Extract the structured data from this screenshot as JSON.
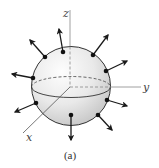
{
  "figure": {
    "caption": "(a)",
    "colors": {
      "sphere_fill_light": "#fbfbfb",
      "sphere_fill_dark": "#cfcfcf",
      "outline": "#333333",
      "axis": "#9a9a9a",
      "arrow": "#1a1a1a",
      "dot": "#111111"
    },
    "sphere": {
      "cx": 71,
      "cy": 86,
      "r": 39.5
    },
    "equator": {
      "cx": 71,
      "cy": 87,
      "rx": 39.5,
      "ry": 10.5
    },
    "axes": {
      "origin": {
        "x": 70,
        "y": 87
      },
      "z": {
        "label": "z",
        "end": {
          "x": 70,
          "y": 10
        }
      },
      "y": {
        "label": "y",
        "end": {
          "x": 141,
          "y": 87
        }
      },
      "x": {
        "label": "x",
        "end": {
          "x": 23,
          "y": 133
        }
      }
    },
    "vectors": [
      {
        "id": "v1",
        "dot": {
          "x": 63,
          "y": 52
        },
        "tip": {
          "x": 59,
          "y": 29
        }
      },
      {
        "id": "v2",
        "dot": {
          "x": 45,
          "y": 57
        },
        "tip": {
          "x": 30,
          "y": 40
        }
      },
      {
        "id": "v3",
        "dot": {
          "x": 33,
          "y": 78
        },
        "tip": {
          "x": 12,
          "y": 74
        }
      },
      {
        "id": "v4",
        "dot": {
          "x": 36,
          "y": 103
        },
        "tip": {
          "x": 15,
          "y": 112
        }
      },
      {
        "id": "v5",
        "dot": {
          "x": 71,
          "y": 115
        },
        "tip": {
          "x": 71,
          "y": 140
        }
      },
      {
        "id": "v6",
        "dot": {
          "x": 98,
          "y": 115
        },
        "tip": {
          "x": 112,
          "y": 130
        }
      },
      {
        "id": "v7",
        "dot": {
          "x": 107,
          "y": 100
        },
        "tip": {
          "x": 127,
          "y": 106
        }
      },
      {
        "id": "v8",
        "dot": {
          "x": 106,
          "y": 71
        },
        "tip": {
          "x": 127,
          "y": 61
        }
      },
      {
        "id": "v9",
        "dot": {
          "x": 93,
          "y": 55
        },
        "tip": {
          "x": 108,
          "y": 35
        }
      }
    ]
  }
}
